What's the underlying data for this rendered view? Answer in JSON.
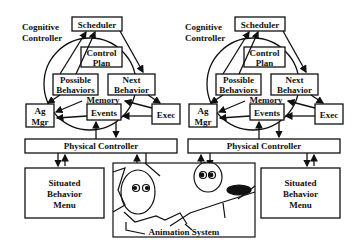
{
  "diagram": {
    "controllers": [
      {
        "label_line1": "Cognitive",
        "label_line2": "Controller",
        "scheduler": "Scheduler",
        "control_plan_line1": "Control",
        "control_plan_line2": "Plan",
        "possible_line1": "Possible",
        "possible_line2": "Behaviors",
        "next_line1": "Next",
        "next_line2": "Behavior",
        "memory": "Memory",
        "events": "Events",
        "ag_mgr_line1": "Ag",
        "ag_mgr_line2": "Mgr",
        "exec": "Exec",
        "physical": "Physical Controller",
        "menu_line1": "Situated",
        "menu_line2": "Behavior",
        "menu_line3": "Menu"
      },
      {
        "label_line1": "Cognitive",
        "label_line2": "Controller",
        "scheduler": "Scheduler",
        "control_plan_line1": "Control",
        "control_plan_line2": "Plan",
        "possible_line1": "Possible",
        "possible_line2": "Behaviors",
        "next_line1": "Next",
        "next_line2": "Behavior",
        "memory": "Memory",
        "events": "Events",
        "ag_mgr_line1": "Ag",
        "ag_mgr_line2": "Mgr",
        "exec": "Exec",
        "physical": "Physical Controller",
        "menu_line1": "Situated",
        "menu_line2": "Behavior",
        "menu_line3": "Menu"
      }
    ],
    "animation_label": "Animation System"
  }
}
